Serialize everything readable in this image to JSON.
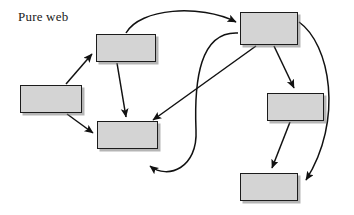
{
  "diagram": {
    "title": "Pure web",
    "type": "node-link-graph",
    "canvas": {
      "width": 354,
      "height": 215,
      "background": "#ffffff"
    },
    "style": {
      "node_fill": "#d4d4d4",
      "node_border": "#1c1c1c",
      "node_shadow": "#787878",
      "edge_color": "#111111"
    },
    "nodes": [
      {
        "id": "n1",
        "label": "",
        "x": 20,
        "y": 85,
        "w": 62,
        "h": 28
      },
      {
        "id": "n2",
        "label": "",
        "x": 96,
        "y": 34,
        "w": 60,
        "h": 28
      },
      {
        "id": "n3",
        "label": "",
        "x": 97,
        "y": 121,
        "w": 61,
        "h": 28
      },
      {
        "id": "n4",
        "label": "",
        "x": 240,
        "y": 12,
        "w": 58,
        "h": 33
      },
      {
        "id": "n5",
        "label": "",
        "x": 267,
        "y": 93,
        "w": 57,
        "h": 28
      },
      {
        "id": "n6",
        "label": "",
        "x": 240,
        "y": 173,
        "w": 58,
        "h": 28
      }
    ],
    "edges": [
      {
        "id": "e1",
        "from": "n1",
        "to": "n2",
        "shape": "straight"
      },
      {
        "id": "e2",
        "from": "n1",
        "to": "n3",
        "shape": "straight"
      },
      {
        "id": "e3",
        "from": "n2",
        "to": "n3",
        "shape": "straight"
      },
      {
        "id": "e4",
        "from": "n2",
        "to": "n4",
        "shape": "curved"
      },
      {
        "id": "e5",
        "from": "n4",
        "to": "n3",
        "shape": "straight"
      },
      {
        "id": "e6",
        "from": "n4",
        "to": "n3",
        "shape": "curved-loop"
      },
      {
        "id": "e7",
        "from": "n4",
        "to": "n5",
        "shape": "straight"
      },
      {
        "id": "e8",
        "from": "n4",
        "to": "n6",
        "shape": "curved"
      },
      {
        "id": "e9",
        "from": "n5",
        "to": "n6",
        "shape": "straight"
      }
    ]
  }
}
